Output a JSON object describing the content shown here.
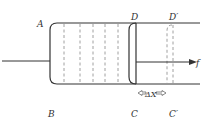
{
  "diagram": {
    "labels": {
      "A": "A",
      "B": "B",
      "C": "C",
      "D": "D",
      "C_prime": "C′",
      "D_prime": "D′",
      "force": "f",
      "displacement": "ΔX"
    },
    "colors": {
      "stroke": "#333333",
      "dashed": "#888888",
      "background": "#ffffff"
    }
  }
}
